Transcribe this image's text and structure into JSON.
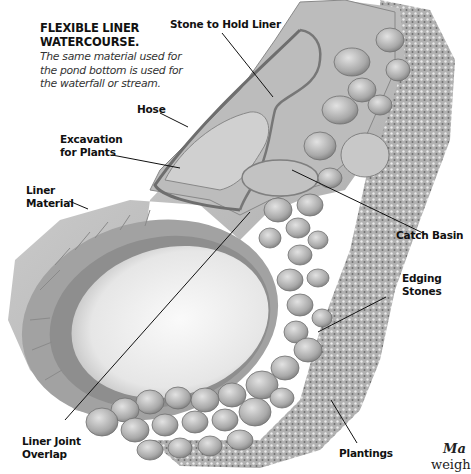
{
  "figure": {
    "title_line1": "FLEXIBLE LINER",
    "title_line2": "WATERCOURSE.",
    "caption": "The same material used for the pond bottom is used for the waterfall or stream."
  },
  "labels": {
    "stone_to_hold_liner": "Stone to Hold Liner",
    "hose": "Hose",
    "excavation_line1": "Excavation",
    "excavation_line2": "for Plants",
    "liner_material_line1": "Liner",
    "liner_material_line2": "Material",
    "catch_basin": "Catch Basin",
    "edging_stones_line1": "Edging",
    "edging_stones_line2": "Stones",
    "liner_joint_line1": "Liner Joint",
    "liner_joint_line2": "Overlap",
    "plantings": "Plantings"
  },
  "cutoff_text": {
    "line1": "Ma",
    "line2": "weigh"
  },
  "colors": {
    "liner": "#c9c9c9",
    "liner_dark": "#8f8f8f",
    "pond_water": "#ededed",
    "stone": "#b5b5b5",
    "planting": "#9a9a9a",
    "leader_line": "#111111"
  }
}
